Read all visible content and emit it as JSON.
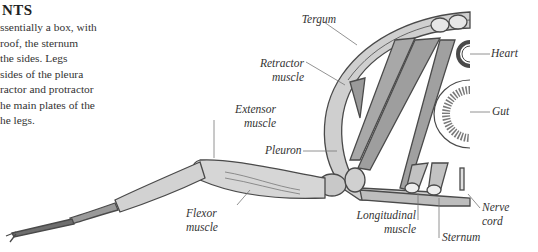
{
  "text_block": {
    "heading": "NTS",
    "lines": [
      "ssentially a box, with",
      " roof, the sternum",
      " the sides. Legs",
      "sides of the pleura",
      "ractor and protractor",
      "he main plates of the",
      "he legs."
    ]
  },
  "diagram": {
    "labels": {
      "tergum": "Tergum",
      "retractor_1": "Retractor",
      "retractor_2": "muscle",
      "extensor_1": "Extensor",
      "extensor_2": "muscle",
      "pleuron": "Pleuron",
      "flexor_1": "Flexor",
      "flexor_2": "muscle",
      "longitudinal_1": "Longitudinal",
      "longitudinal_2": "muscle",
      "sternum": "Sternum",
      "nerve_1": "Nerve",
      "nerve_2": "cord",
      "heart": "Heart",
      "gut": "Gut"
    },
    "colors": {
      "outline": "#4a4a4a",
      "fill_light": "#d8d8d8",
      "fill_mid": "#b5b5b5",
      "fill_dark": "#8a8a8a",
      "leader_line": "#777777"
    }
  }
}
